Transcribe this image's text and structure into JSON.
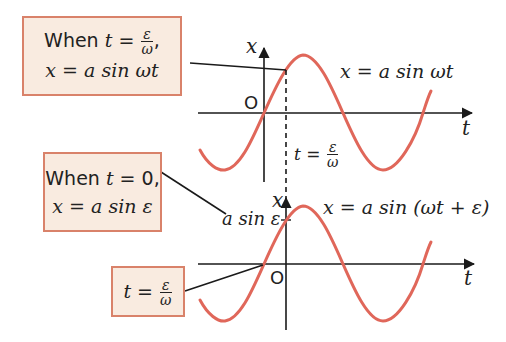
{
  "boxes": [
    {
      "id": "box-top",
      "line1_prefix": "When ",
      "line1_var": "t",
      "line1_eq": " = ",
      "line1_frac_num": "ε",
      "line1_frac_den": "ω",
      "line1_suffix": ",",
      "line2": "x = a sin ωt"
    },
    {
      "id": "box-middle",
      "line1_prefix": "When ",
      "line1_var": "t",
      "line1_rest": " = 0,",
      "line2": "x = a sin ε"
    },
    {
      "id": "box-bottom",
      "var": "t",
      "eq": " = ",
      "frac_num": "ε",
      "frac_den": "ω"
    }
  ],
  "top_graph": {
    "x_axis_label": "x",
    "t_axis_label": "t",
    "origin_label": "O",
    "curve_label": "x = a sin ωt",
    "dash_label_var": "t",
    "dash_label_eq": " = ",
    "dash_label_num": "ε",
    "dash_label_den": "ω"
  },
  "bottom_graph": {
    "x_axis_label": "x",
    "t_axis_label": "t",
    "origin_label": "O",
    "curve_label": "x = a sin (ωt + ε)",
    "intercept_label": "a sin ε"
  },
  "colors": {
    "curve": "#e0675a",
    "box_fill": "#f9ebe0",
    "box_border": "#d9826a",
    "axis": "#1a1a1a"
  }
}
